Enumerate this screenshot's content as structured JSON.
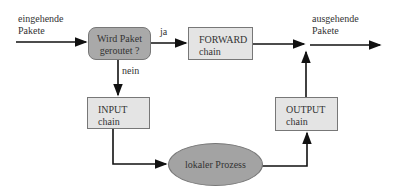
{
  "diagram": {
    "incoming_label": [
      "eingehende",
      "Pakete"
    ],
    "outgoing_label": [
      "ausgehende",
      "Pakete"
    ],
    "decision": {
      "line1": "Wird Paket",
      "line2": "geroutet ?"
    },
    "yes_label": "ja",
    "no_label": "nein",
    "forward_chain": {
      "line1": "FORWARD",
      "line2": "chain"
    },
    "input_chain": {
      "line1": "INPUT",
      "line2": "chain"
    },
    "output_chain": {
      "line1": "OUTPUT",
      "line2": "chain"
    },
    "local_process": "lokaler Prozess",
    "colors": {
      "decision_fill": "#a9a9a9",
      "chain_fill": "#e4e4e4",
      "process_fill": "#a3a3a3",
      "line": "#111111"
    }
  }
}
